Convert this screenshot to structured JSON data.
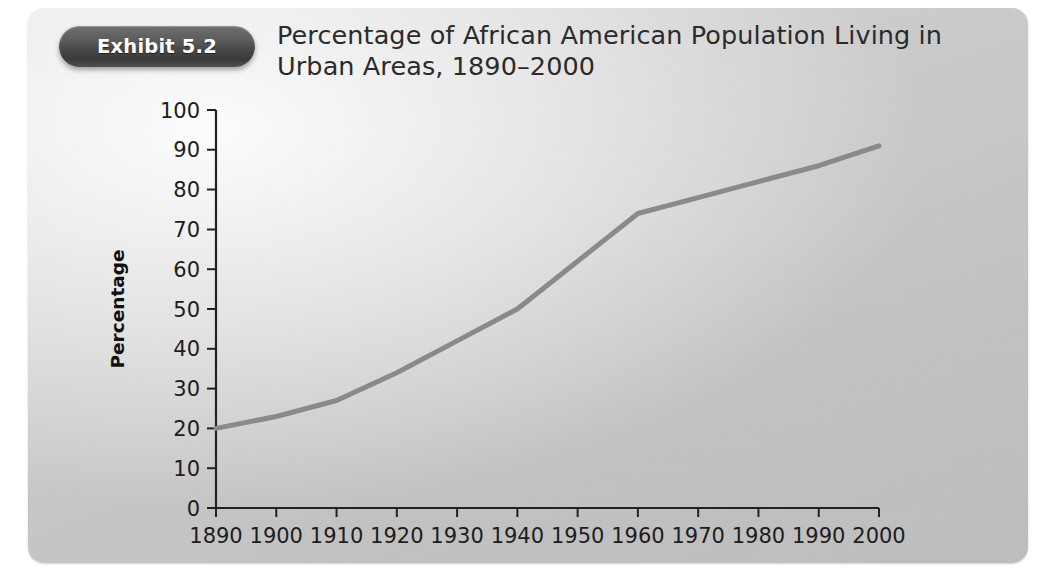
{
  "exhibit": {
    "badge_label": "Exhibit 5.2",
    "title": "Percentage of African American Population Living in Urban Areas, 1890–2000"
  },
  "colors": {
    "panel_light": "#d9d9d9",
    "panel_dark": "#bdbdbd",
    "badge_dark": "#3a3a3a",
    "badge_light": "#6f6f6f",
    "line": "#8a8a8a",
    "axis": "#222222",
    "text": "#1d1d1d"
  },
  "chart_data": {
    "type": "line",
    "title": "Percentage of African American Population Living in Urban Areas, 1890–2000",
    "xlabel": "",
    "ylabel": "Percentage",
    "x": [
      1890,
      1900,
      1910,
      1920,
      1930,
      1940,
      1950,
      1960,
      1970,
      1980,
      1990,
      2000
    ],
    "xticklabels": [
      "1890",
      "1900",
      "1910",
      "1920",
      "1930",
      "1940",
      "1950",
      "1960",
      "1970",
      "1980",
      "1990",
      "2000"
    ],
    "values": [
      20,
      23,
      27,
      34,
      42,
      50,
      62,
      74,
      78,
      82,
      86,
      91
    ],
    "yticks": [
      0,
      10,
      20,
      30,
      40,
      50,
      60,
      70,
      80,
      90,
      100
    ],
    "yticklabels": [
      "0",
      "10",
      "20",
      "30",
      "40",
      "50",
      "60",
      "70",
      "80",
      "90",
      "100"
    ],
    "xlim": [
      1890,
      2000
    ],
    "ylim": [
      0,
      100
    ],
    "grid": false,
    "legend": false,
    "series_name": "Percentage urban"
  }
}
